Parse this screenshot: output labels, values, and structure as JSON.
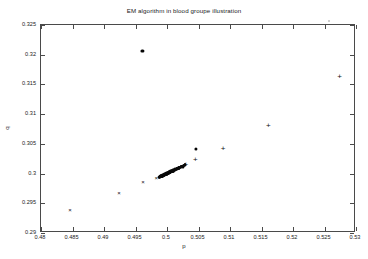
{
  "figure": {
    "title": "EM algorithm in blood groupe illustration",
    "background": "#ffffff",
    "axis_color": "#4a4a4a",
    "marker_color": "#111111"
  },
  "chart_data": {
    "type": "scatter",
    "title": "EM algorithm in blood groupe illustration",
    "xlabel": "p",
    "ylabel": "q",
    "xlim": [
      0.48,
      0.53
    ],
    "ylim": [
      0.29,
      0.325
    ],
    "xticks": [
      0.48,
      0.485,
      0.49,
      0.495,
      0.5,
      0.505,
      0.51,
      0.515,
      0.52,
      0.525,
      0.53
    ],
    "xticklabels": [
      "0.48",
      "0.485",
      "0.49",
      "0.495",
      "0.5",
      "0.505",
      "0.51",
      "0.515",
      "0.52",
      "0.525",
      "0.53"
    ],
    "yticks": [
      0.29,
      0.295,
      0.3,
      0.305,
      0.31,
      0.315,
      0.32,
      0.325
    ],
    "yticklabels": [
      "0.29",
      "0.295",
      "0.3",
      "0.305",
      "0.31",
      "0.315",
      "0.32",
      "0.325"
    ],
    "grid": false,
    "legend": null,
    "series": [
      {
        "name": "EM iterates",
        "marker": "mixed",
        "points": [
          {
            "p": 0.4846,
            "q": 0.2939,
            "marker": "x"
          },
          {
            "p": 0.4924,
            "q": 0.2968,
            "marker": "x"
          },
          {
            "p": 0.4962,
            "q": 0.2985,
            "marker": "x"
          },
          {
            "p": 0.4983,
            "q": 0.2993,
            "marker": "x"
          },
          {
            "p": 0.499,
            "q": 0.2996,
            "marker": "dot"
          },
          {
            "p": 0.4994,
            "q": 0.2998,
            "marker": "dot"
          },
          {
            "p": 0.4997,
            "q": 0.2999,
            "marker": "dot"
          },
          {
            "p": 0.4999,
            "q": 0.3,
            "marker": "dot"
          },
          {
            "p": 0.5001,
            "q": 0.3001,
            "marker": "dot"
          },
          {
            "p": 0.5003,
            "q": 0.3002,
            "marker": "dot"
          },
          {
            "p": 0.5005,
            "q": 0.3003,
            "marker": "dot"
          },
          {
            "p": 0.5007,
            "q": 0.3004,
            "marker": "dot"
          },
          {
            "p": 0.5009,
            "q": 0.3005,
            "marker": "dot"
          },
          {
            "p": 0.5011,
            "q": 0.3006,
            "marker": "dot"
          },
          {
            "p": 0.5013,
            "q": 0.3007,
            "marker": "dot"
          },
          {
            "p": 0.5015,
            "q": 0.3008,
            "marker": "dot"
          },
          {
            "p": 0.5017,
            "q": 0.3009,
            "marker": "dot"
          },
          {
            "p": 0.5019,
            "q": 0.301,
            "marker": "dot"
          },
          {
            "p": 0.5022,
            "q": 0.3011,
            "marker": "dot"
          },
          {
            "p": 0.5025,
            "q": 0.3012,
            "marker": "dot"
          },
          {
            "p": 0.5028,
            "q": 0.3014,
            "marker": "dot"
          },
          {
            "p": 0.503,
            "q": 0.3015,
            "marker": "plus"
          },
          {
            "p": 0.5045,
            "q": 0.3022,
            "marker": "plus"
          },
          {
            "p": 0.5046,
            "q": 0.3042,
            "marker": "dot"
          },
          {
            "p": 0.5089,
            "q": 0.3042,
            "marker": "plus"
          },
          {
            "p": 0.5161,
            "q": 0.308,
            "marker": "plus"
          },
          {
            "p": 0.5274,
            "q": 0.3163,
            "marker": "plus"
          },
          {
            "p": 0.4961,
            "q": 0.3207,
            "marker": "dot"
          }
        ]
      }
    ]
  }
}
